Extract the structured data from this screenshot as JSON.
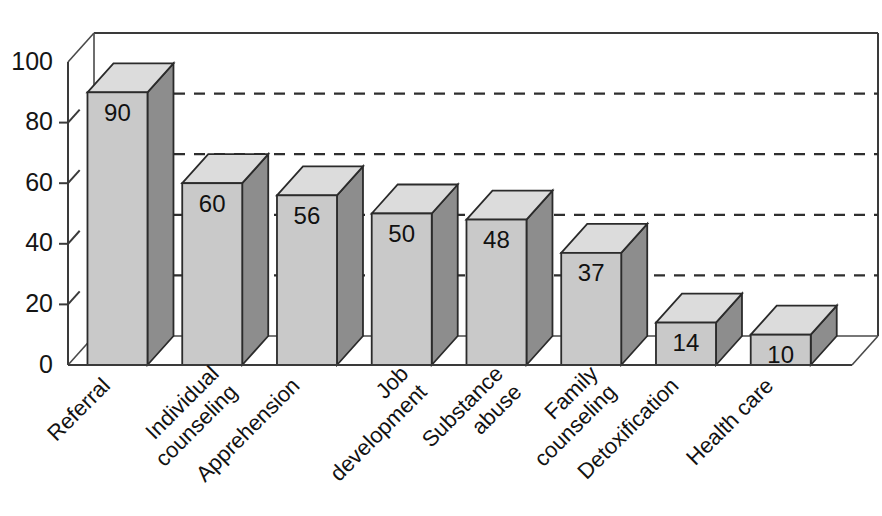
{
  "chart_data": {
    "type": "bar",
    "title": "",
    "subtitle": "",
    "xlabel": "",
    "ylabel": "",
    "ylim": [
      0,
      100
    ],
    "yticks": [
      0,
      20,
      40,
      60,
      80,
      100
    ],
    "ytick_labels": [
      "0",
      "20",
      "40",
      "60",
      "80",
      "100"
    ],
    "gridlines": [
      20,
      40,
      60,
      80
    ],
    "grid": true,
    "grid_style": "dashed-horizontal-back-wall",
    "legend": null,
    "legend_position": "none",
    "three_d": true,
    "categories": [
      "Referral",
      "Individual counseling",
      "Apprehension",
      "Job development",
      "Substance abuse",
      "Family counseling",
      "Detoxification",
      "Health care"
    ],
    "category_label_lines": [
      [
        "Referral"
      ],
      [
        "Individual",
        "counseling"
      ],
      [
        "Apprehension"
      ],
      [
        "Job",
        "development"
      ],
      [
        "Substance",
        "abuse"
      ],
      [
        "Family",
        "counseling"
      ],
      [
        "Detoxification"
      ],
      [
        "Health care"
      ]
    ],
    "values": [
      90,
      60,
      56,
      50,
      48,
      37,
      14,
      10
    ],
    "value_labels": [
      "90",
      "60",
      "56",
      "50",
      "48",
      "37",
      "14",
      "10"
    ],
    "colors": {
      "bar_front": "#c9c9c9",
      "bar_side": "#8d8d8d",
      "bar_top": "#dcdcdc",
      "outline": "#2b2b2b",
      "background": "#ffffff",
      "grid": "#2e2e2e",
      "text": "#121212"
    }
  },
  "axis": {
    "y_tick_0": "0",
    "y_tick_20": "20",
    "y_tick_40": "40",
    "y_tick_60": "60",
    "y_tick_80": "80",
    "y_tick_100": "100"
  },
  "bars": [
    {
      "label": "Referral",
      "value_label": "90",
      "line1": "Referral",
      "line2": ""
    },
    {
      "label": "Individual counseling",
      "value_label": "60",
      "line1": "Individual",
      "line2": "counseling"
    },
    {
      "label": "Apprehension",
      "value_label": "56",
      "line1": "Apprehension",
      "line2": ""
    },
    {
      "label": "Job development",
      "value_label": "50",
      "line1": "Job",
      "line2": "development"
    },
    {
      "label": "Substance abuse",
      "value_label": "48",
      "line1": "Substance",
      "line2": "abuse"
    },
    {
      "label": "Family counseling",
      "value_label": "37",
      "line1": "Family",
      "line2": "counseling"
    },
    {
      "label": "Detoxification",
      "value_label": "14",
      "line1": "Detoxification",
      "line2": ""
    },
    {
      "label": "Health care",
      "value_label": "10",
      "line1": "Health care",
      "line2": ""
    }
  ]
}
